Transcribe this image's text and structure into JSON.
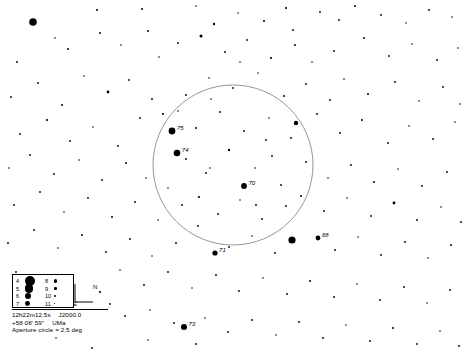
{
  "chart": {
    "background_color": "#ffffff",
    "star_color": "#000000",
    "circle_color": "#8a8a8a",
    "width": 467,
    "height": 352
  },
  "aperture_circle": {
    "label": "Aperture circle = 2.5 deg",
    "center_x": 233,
    "center_y": 165,
    "radius": 80,
    "diameter_deg": 2.5
  },
  "coordinates": {
    "right_ascension": "12h22m12.5s",
    "epoch": "J2000.0",
    "declination": "+58 08' 59\"",
    "constellation": "UMa"
  },
  "compass": {
    "north_label": "N",
    "east_label": "E"
  },
  "magnitude_legend": {
    "rows": [
      {
        "left_mag": "4",
        "left_size": 5.0,
        "right_mag": "8",
        "right_size": 1.7
      },
      {
        "left_mag": "5",
        "left_size": 4.2,
        "right_mag": "9",
        "right_size": 1.3
      },
      {
        "left_mag": "6",
        "left_size": 3.2,
        "right_mag": "10",
        "right_size": 1.0
      },
      {
        "left_mag": "7",
        "left_size": 2.4,
        "right_mag": "11",
        "right_size": 0.7
      }
    ]
  },
  "chart_data": {
    "type": "scatter",
    "xlabel": "",
    "ylabel": "",
    "xlim": [
      0,
      467
    ],
    "ylim": [
      0,
      352
    ],
    "grid": false,
    "legend": "magnitude size key, lower-left",
    "labeled_stars": [
      {
        "label": "75",
        "x": 172,
        "y": 131,
        "r": 3.4
      },
      {
        "label": "74",
        "x": 177,
        "y": 153,
        "r": 3.3
      },
      {
        "label": "70",
        "x": 244,
        "y": 186,
        "r": 2.9
      },
      {
        "label": "71",
        "x": 215,
        "y": 253,
        "r": 2.6
      },
      {
        "label": "68",
        "x": 318,
        "y": 238,
        "r": 2.4
      },
      {
        "label": "73",
        "x": 184,
        "y": 327,
        "r": 3.0
      }
    ],
    "stars": [
      {
        "x": 33,
        "y": 22,
        "r": 3.8
      },
      {
        "x": 97,
        "y": 10,
        "r": 1.0
      },
      {
        "x": 142,
        "y": 9,
        "r": 1.0
      },
      {
        "x": 196,
        "y": 6,
        "r": 0.8
      },
      {
        "x": 214,
        "y": 24,
        "r": 1.2
      },
      {
        "x": 238,
        "y": 13,
        "r": 0.8
      },
      {
        "x": 264,
        "y": 21,
        "r": 1.0
      },
      {
        "x": 286,
        "y": 8,
        "r": 1.1
      },
      {
        "x": 293,
        "y": 30,
        "r": 0.9
      },
      {
        "x": 320,
        "y": 12,
        "r": 0.9
      },
      {
        "x": 339,
        "y": 20,
        "r": 0.9
      },
      {
        "x": 355,
        "y": 6,
        "r": 1.0
      },
      {
        "x": 381,
        "y": 15,
        "r": 0.9
      },
      {
        "x": 406,
        "y": 23,
        "r": 0.8
      },
      {
        "x": 429,
        "y": 10,
        "r": 0.9
      },
      {
        "x": 452,
        "y": 17,
        "r": 0.8
      },
      {
        "x": 17,
        "y": 62,
        "r": 0.9
      },
      {
        "x": 55,
        "y": 38,
        "r": 0.8
      },
      {
        "x": 68,
        "y": 49,
        "r": 1.0
      },
      {
        "x": 100,
        "y": 33,
        "r": 0.9
      },
      {
        "x": 121,
        "y": 45,
        "r": 0.8
      },
      {
        "x": 148,
        "y": 31,
        "r": 1.0
      },
      {
        "x": 159,
        "y": 57,
        "r": 0.8
      },
      {
        "x": 178,
        "y": 43,
        "r": 0.9
      },
      {
        "x": 201,
        "y": 36,
        "r": 1.5
      },
      {
        "x": 225,
        "y": 52,
        "r": 0.9
      },
      {
        "x": 247,
        "y": 40,
        "r": 0.9
      },
      {
        "x": 271,
        "y": 58,
        "r": 1.1
      },
      {
        "x": 295,
        "y": 45,
        "r": 1.0
      },
      {
        "x": 312,
        "y": 62,
        "r": 0.8
      },
      {
        "x": 334,
        "y": 51,
        "r": 0.9
      },
      {
        "x": 364,
        "y": 38,
        "r": 1.0
      },
      {
        "x": 389,
        "y": 56,
        "r": 0.9
      },
      {
        "x": 412,
        "y": 44,
        "r": 0.8
      },
      {
        "x": 437,
        "y": 60,
        "r": 0.9
      },
      {
        "x": 458,
        "y": 48,
        "r": 0.8
      },
      {
        "x": 11,
        "y": 97,
        "r": 0.9
      },
      {
        "x": 38,
        "y": 83,
        "r": 0.9
      },
      {
        "x": 62,
        "y": 105,
        "r": 1.0
      },
      {
        "x": 84,
        "y": 76,
        "r": 0.8
      },
      {
        "x": 108,
        "y": 92,
        "r": 1.4
      },
      {
        "x": 129,
        "y": 80,
        "r": 0.9
      },
      {
        "x": 152,
        "y": 99,
        "r": 0.9
      },
      {
        "x": 186,
        "y": 95,
        "r": 0.9
      },
      {
        "x": 209,
        "y": 78,
        "r": 0.8
      },
      {
        "x": 233,
        "y": 88,
        "r": 0.9
      },
      {
        "x": 258,
        "y": 73,
        "r": 0.8
      },
      {
        "x": 284,
        "y": 96,
        "r": 1.0
      },
      {
        "x": 306,
        "y": 84,
        "r": 0.9
      },
      {
        "x": 330,
        "y": 100,
        "r": 0.9
      },
      {
        "x": 344,
        "y": 79,
        "r": 0.8
      },
      {
        "x": 368,
        "y": 94,
        "r": 1.0
      },
      {
        "x": 395,
        "y": 82,
        "r": 0.9
      },
      {
        "x": 419,
        "y": 101,
        "r": 0.8
      },
      {
        "x": 443,
        "y": 87,
        "r": 0.9
      },
      {
        "x": 460,
        "y": 104,
        "r": 0.8
      },
      {
        "x": 20,
        "y": 134,
        "r": 0.9
      },
      {
        "x": 47,
        "y": 120,
        "r": 1.1
      },
      {
        "x": 70,
        "y": 141,
        "r": 0.9
      },
      {
        "x": 93,
        "y": 127,
        "r": 0.8
      },
      {
        "x": 118,
        "y": 146,
        "r": 0.9
      },
      {
        "x": 140,
        "y": 118,
        "r": 0.9
      },
      {
        "x": 163,
        "y": 114,
        "r": 1.1
      },
      {
        "x": 196,
        "y": 128,
        "r": 1.0
      },
      {
        "x": 220,
        "y": 112,
        "r": 0.9
      },
      {
        "x": 244,
        "y": 131,
        "r": 0.9
      },
      {
        "x": 269,
        "y": 118,
        "r": 0.8
      },
      {
        "x": 291,
        "y": 138,
        "r": 0.9
      },
      {
        "x": 296,
        "y": 123,
        "r": 2.2
      },
      {
        "x": 317,
        "y": 114,
        "r": 0.9
      },
      {
        "x": 340,
        "y": 133,
        "r": 0.9
      },
      {
        "x": 362,
        "y": 120,
        "r": 1.0
      },
      {
        "x": 388,
        "y": 143,
        "r": 0.9
      },
      {
        "x": 409,
        "y": 126,
        "r": 0.8
      },
      {
        "x": 433,
        "y": 139,
        "r": 0.9
      },
      {
        "x": 455,
        "y": 122,
        "r": 0.8
      },
      {
        "x": 9,
        "y": 168,
        "r": 0.8
      },
      {
        "x": 30,
        "y": 155,
        "r": 0.9
      },
      {
        "x": 54,
        "y": 174,
        "r": 0.9
      },
      {
        "x": 79,
        "y": 160,
        "r": 0.8
      },
      {
        "x": 102,
        "y": 180,
        "r": 0.9
      },
      {
        "x": 126,
        "y": 163,
        "r": 1.0
      },
      {
        "x": 146,
        "y": 178,
        "r": 0.8
      },
      {
        "x": 186,
        "y": 159,
        "r": 0.9
      },
      {
        "x": 206,
        "y": 173,
        "r": 0.9
      },
      {
        "x": 229,
        "y": 150,
        "r": 1.2
      },
      {
        "x": 255,
        "y": 168,
        "r": 0.8
      },
      {
        "x": 272,
        "y": 156,
        "r": 0.9
      },
      {
        "x": 281,
        "y": 185,
        "r": 0.9
      },
      {
        "x": 306,
        "y": 162,
        "r": 0.9
      },
      {
        "x": 328,
        "y": 178,
        "r": 0.8
      },
      {
        "x": 351,
        "y": 165,
        "r": 0.9
      },
      {
        "x": 374,
        "y": 182,
        "r": 1.0
      },
      {
        "x": 398,
        "y": 169,
        "r": 0.8
      },
      {
        "x": 422,
        "y": 186,
        "r": 0.9
      },
      {
        "x": 447,
        "y": 172,
        "r": 0.9
      },
      {
        "x": 14,
        "y": 205,
        "r": 0.9
      },
      {
        "x": 40,
        "y": 192,
        "r": 0.9
      },
      {
        "x": 64,
        "y": 212,
        "r": 0.8
      },
      {
        "x": 88,
        "y": 198,
        "r": 0.9
      },
      {
        "x": 112,
        "y": 217,
        "r": 1.0
      },
      {
        "x": 135,
        "y": 202,
        "r": 0.9
      },
      {
        "x": 158,
        "y": 220,
        "r": 0.8
      },
      {
        "x": 182,
        "y": 205,
        "r": 0.9
      },
      {
        "x": 199,
        "y": 197,
        "r": 1.1
      },
      {
        "x": 218,
        "y": 214,
        "r": 0.9
      },
      {
        "x": 240,
        "y": 200,
        "r": 0.8
      },
      {
        "x": 262,
        "y": 219,
        "r": 0.9
      },
      {
        "x": 286,
        "y": 206,
        "r": 0.9
      },
      {
        "x": 301,
        "y": 196,
        "r": 1.0
      },
      {
        "x": 324,
        "y": 211,
        "r": 0.9
      },
      {
        "x": 347,
        "y": 198,
        "r": 0.8
      },
      {
        "x": 371,
        "y": 216,
        "r": 0.9
      },
      {
        "x": 394,
        "y": 203,
        "r": 1.4
      },
      {
        "x": 417,
        "y": 220,
        "r": 0.9
      },
      {
        "x": 441,
        "y": 207,
        "r": 0.8
      },
      {
        "x": 461,
        "y": 222,
        "r": 0.9
      },
      {
        "x": 8,
        "y": 243,
        "r": 0.9
      },
      {
        "x": 34,
        "y": 230,
        "r": 0.9
      },
      {
        "x": 58,
        "y": 248,
        "r": 0.8
      },
      {
        "x": 82,
        "y": 235,
        "r": 1.0
      },
      {
        "x": 106,
        "y": 252,
        "r": 0.9
      },
      {
        "x": 130,
        "y": 239,
        "r": 0.9
      },
      {
        "x": 152,
        "y": 256,
        "r": 0.8
      },
      {
        "x": 176,
        "y": 243,
        "r": 0.9
      },
      {
        "x": 229,
        "y": 247,
        "r": 0.9
      },
      {
        "x": 252,
        "y": 236,
        "r": 0.8
      },
      {
        "x": 275,
        "y": 253,
        "r": 0.9
      },
      {
        "x": 292,
        "y": 240,
        "r": 3.6
      },
      {
        "x": 335,
        "y": 250,
        "r": 0.9
      },
      {
        "x": 358,
        "y": 237,
        "r": 0.8
      },
      {
        "x": 381,
        "y": 255,
        "r": 0.9
      },
      {
        "x": 405,
        "y": 242,
        "r": 0.9
      },
      {
        "x": 428,
        "y": 258,
        "r": 0.8
      },
      {
        "x": 451,
        "y": 245,
        "r": 1.0
      },
      {
        "x": 16,
        "y": 272,
        "r": 0.9
      },
      {
        "x": 120,
        "y": 270,
        "r": 0.8
      },
      {
        "x": 144,
        "y": 285,
        "r": 0.9
      },
      {
        "x": 168,
        "y": 272,
        "r": 0.9
      },
      {
        "x": 192,
        "y": 288,
        "r": 0.8
      },
      {
        "x": 216,
        "y": 275,
        "r": 0.9
      },
      {
        "x": 239,
        "y": 291,
        "r": 0.9
      },
      {
        "x": 263,
        "y": 278,
        "r": 0.8
      },
      {
        "x": 287,
        "y": 294,
        "r": 0.9
      },
      {
        "x": 310,
        "y": 281,
        "r": 1.0
      },
      {
        "x": 334,
        "y": 297,
        "r": 0.9
      },
      {
        "x": 357,
        "y": 284,
        "r": 0.8
      },
      {
        "x": 380,
        "y": 300,
        "r": 0.9
      },
      {
        "x": 404,
        "y": 287,
        "r": 0.9
      },
      {
        "x": 427,
        "y": 303,
        "r": 0.8
      },
      {
        "x": 450,
        "y": 290,
        "r": 0.9
      },
      {
        "x": 100,
        "y": 292,
        "r": 1.1
      },
      {
        "x": 110,
        "y": 304,
        "r": 0.9
      },
      {
        "x": 125,
        "y": 316,
        "r": 0.9
      },
      {
        "x": 150,
        "y": 310,
        "r": 0.8
      },
      {
        "x": 174,
        "y": 323,
        "r": 0.9
      },
      {
        "x": 205,
        "y": 318,
        "r": 0.8
      },
      {
        "x": 228,
        "y": 332,
        "r": 0.9
      },
      {
        "x": 252,
        "y": 320,
        "r": 0.9
      },
      {
        "x": 276,
        "y": 335,
        "r": 0.8
      },
      {
        "x": 299,
        "y": 322,
        "r": 0.9
      },
      {
        "x": 323,
        "y": 338,
        "r": 0.9
      },
      {
        "x": 346,
        "y": 325,
        "r": 0.8
      },
      {
        "x": 370,
        "y": 341,
        "r": 0.9
      },
      {
        "x": 393,
        "y": 328,
        "r": 1.0
      },
      {
        "x": 417,
        "y": 344,
        "r": 0.9
      },
      {
        "x": 440,
        "y": 331,
        "r": 0.8
      },
      {
        "x": 459,
        "y": 346,
        "r": 0.9
      },
      {
        "x": 196,
        "y": 344,
        "r": 0.9
      },
      {
        "x": 148,
        "y": 340,
        "r": 0.8
      },
      {
        "x": 92,
        "y": 348,
        "r": 0.9
      },
      {
        "x": 56,
        "y": 338,
        "r": 0.8
      },
      {
        "x": 240,
        "y": 62,
        "r": 0.8
      },
      {
        "x": 168,
        "y": 188,
        "r": 0.8
      },
      {
        "x": 210,
        "y": 168,
        "r": 0.8
      },
      {
        "x": 256,
        "y": 205,
        "r": 0.9
      },
      {
        "x": 198,
        "y": 226,
        "r": 0.9
      },
      {
        "x": 266,
        "y": 140,
        "r": 0.9
      },
      {
        "x": 178,
        "y": 111,
        "r": 0.8
      },
      {
        "x": 211,
        "y": 99,
        "r": 0.8
      }
    ]
  }
}
